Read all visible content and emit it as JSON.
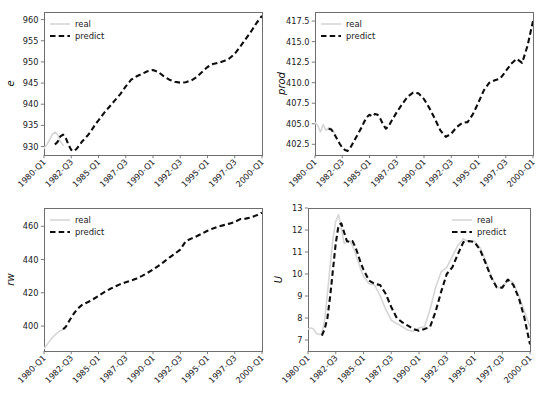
{
  "figure": {
    "width": 537,
    "height": 399,
    "background": "#ffffff",
    "layout": "2x2 grid of time-series subplots",
    "colors": {
      "real": "#d6d6d6",
      "predict": "#0d0d0d",
      "spine": "#6e6e6e",
      "text": "#202020"
    }
  },
  "legend": {
    "real_label": "real",
    "predict_label": "predict"
  },
  "shared": {
    "xticklabels": [
      "1980-Q1",
      "1982-Q3",
      "1985-Q1",
      "1987-Q3",
      "1990-Q1",
      "1992-Q3",
      "1995-Q1",
      "1997-Q3",
      "2000-Q1"
    ]
  },
  "chart_data": [
    {
      "id": "panel-e",
      "type": "line",
      "title": "",
      "xlabel": "",
      "ylabel": "e",
      "legend_position": "upper left",
      "grid": false,
      "xlim": [
        0,
        80
      ],
      "ylim": [
        928.0,
        961.8
      ],
      "yticks": [
        930,
        935,
        940,
        945,
        950,
        955,
        960
      ],
      "yticklabels": [
        "930",
        "935",
        "940",
        "945",
        "950",
        "955",
        "960"
      ],
      "xticks": [
        0,
        10,
        20,
        30,
        40,
        50,
        60,
        70,
        80
      ],
      "xticklabels": [
        "1980-Q1",
        "1982-Q3",
        "1985-Q1",
        "1987-Q3",
        "1990-Q1",
        "1992-Q3",
        "1995-Q1",
        "1997-Q3",
        "2000-Q1"
      ],
      "series": [
        {
          "name": "real",
          "x": [
            0,
            1,
            2,
            3,
            4,
            5,
            6,
            7
          ],
          "values": [
            929.6,
            930.4,
            931.6,
            932.8,
            933.4,
            932.8,
            931.2,
            930.3
          ]
        },
        {
          "name": "predict",
          "x": [
            4,
            5,
            6,
            7,
            8,
            9,
            10,
            11,
            12,
            13,
            14,
            15,
            16,
            17,
            18,
            19,
            20,
            22,
            24,
            26,
            28,
            30,
            32,
            34,
            36,
            38,
            40,
            42,
            44,
            46,
            48,
            50,
            52,
            54,
            56,
            58,
            60,
            62,
            64,
            66,
            68,
            70,
            72,
            74,
            76,
            78,
            80
          ],
          "values": [
            930.5,
            931.1,
            932.4,
            932.8,
            932.0,
            930.4,
            929.2,
            928.9,
            929.5,
            930.3,
            931.2,
            931.9,
            932.6,
            933.4,
            934.4,
            935.4,
            936.2,
            937.9,
            939.4,
            940.9,
            942.4,
            944.2,
            945.8,
            946.6,
            947.2,
            947.8,
            948.1,
            947.6,
            946.6,
            945.8,
            945.3,
            945.1,
            945.2,
            945.6,
            946.4,
            947.6,
            948.8,
            949.5,
            949.8,
            950.2,
            950.8,
            951.9,
            953.6,
            955.4,
            957.2,
            959.2,
            960.9
          ]
        }
      ]
    },
    {
      "id": "panel-prod",
      "type": "line",
      "title": "",
      "xlabel": "",
      "ylabel": "prod",
      "legend_position": "upper left",
      "grid": false,
      "xlim": [
        0,
        80
      ],
      "ylim": [
        401.2,
        418.6
      ],
      "yticks": [
        402.5,
        405.0,
        407.5,
        410.0,
        412.5,
        415.0,
        417.5
      ],
      "yticklabels": [
        "402.5",
        "405.0",
        "407.5",
        "410.0",
        "412.5",
        "415.0",
        "417.5"
      ],
      "xticks": [
        0,
        10,
        20,
        30,
        40,
        50,
        60,
        70,
        80
      ],
      "xticklabels": [
        "1980-Q1",
        "1982-Q3",
        "1985-Q1",
        "1987-Q3",
        "1990-Q1",
        "1992-Q3",
        "1995-Q1",
        "1997-Q3",
        "2000-Q1"
      ],
      "series": [
        {
          "name": "real",
          "x": [
            0,
            1,
            2,
            3,
            4,
            5,
            6,
            7
          ],
          "values": [
            405.1,
            404.8,
            404.0,
            404.9,
            404.2,
            404.5,
            404.4,
            403.9
          ]
        },
        {
          "name": "predict",
          "x": [
            5,
            6,
            7,
            8,
            9,
            10,
            11,
            12,
            13,
            14,
            15,
            16,
            17,
            18,
            19,
            20,
            21,
            22,
            23,
            24,
            25,
            26,
            27,
            28,
            30,
            32,
            34,
            36,
            38,
            40,
            42,
            44,
            46,
            48,
            50,
            52,
            54,
            56,
            58,
            60,
            62,
            64,
            66,
            68,
            70,
            72,
            74,
            76,
            78,
            80
          ],
          "values": [
            404.4,
            404.3,
            403.8,
            403.2,
            402.6,
            402.1,
            401.8,
            401.7,
            402.1,
            402.7,
            403.3,
            403.9,
            404.5,
            405.2,
            405.8,
            406.1,
            405.9,
            406.2,
            406.1,
            405.6,
            404.9,
            404.4,
            404.7,
            405.3,
            406.4,
            407.4,
            408.3,
            408.8,
            408.7,
            408.0,
            406.9,
            405.6,
            404.2,
            403.4,
            403.8,
            404.6,
            405.1,
            405.2,
            406.2,
            407.6,
            409.1,
            410.0,
            410.3,
            410.5,
            411.4,
            412.3,
            412.9,
            412.4,
            414.5,
            417.5
          ]
        }
      ]
    },
    {
      "id": "panel-rw",
      "type": "line",
      "title": "",
      "xlabel": "",
      "ylabel": "rw",
      "legend_position": "upper left",
      "grid": false,
      "xlim": [
        0,
        80
      ],
      "ylim": [
        385.0,
        471.0
      ],
      "yticks": [
        400,
        420,
        440,
        460
      ],
      "yticklabels": [
        "400",
        "420",
        "440",
        "460"
      ],
      "xticks": [
        0,
        10,
        20,
        30,
        40,
        50,
        60,
        70,
        80
      ],
      "xticklabels": [
        "1980-Q1",
        "1982-Q3",
        "1985-Q1",
        "1987-Q3",
        "1990-Q1",
        "1992-Q3",
        "1995-Q1",
        "1997-Q3",
        "2000-Q1"
      ],
      "series": [
        {
          "name": "real",
          "x": [
            0,
            1,
            2,
            3,
            4,
            5,
            6,
            7,
            8
          ],
          "values": [
            386.4,
            388.6,
            390.8,
            392.9,
            394.6,
            396.1,
            397.2,
            398.0,
            398.6
          ]
        },
        {
          "name": "predict",
          "x": [
            7,
            8,
            9,
            10,
            11,
            12,
            13,
            14,
            15,
            16,
            18,
            20,
            22,
            24,
            26,
            28,
            30,
            32,
            34,
            36,
            38,
            40,
            42,
            44,
            46,
            48,
            50,
            52,
            54,
            56,
            58,
            60,
            62,
            64,
            66,
            68,
            70,
            72,
            74,
            76,
            78,
            80
          ],
          "values": [
            398.1,
            399.6,
            402.4,
            405.1,
            407.6,
            409.7,
            411.4,
            412.7,
            413.6,
            414.3,
            416.1,
            418.2,
            420.3,
            422.1,
            423.7,
            425.2,
            426.3,
            427.4,
            428.6,
            430.2,
            432.0,
            434.0,
            436.2,
            438.6,
            441.2,
            443.5,
            446.0,
            451.0,
            452.6,
            454.0,
            455.6,
            457.3,
            458.7,
            459.8,
            460.7,
            461.6,
            462.6,
            464.3,
            464.6,
            465.4,
            466.6,
            468.2
          ]
        }
      ]
    },
    {
      "id": "panel-u",
      "type": "line",
      "title": "",
      "xlabel": "",
      "ylabel": "U",
      "legend_position": "upper right",
      "grid": false,
      "xlim": [
        0,
        80
      ],
      "ylim": [
        6.5,
        13.0
      ],
      "yticks": [
        7,
        8,
        9,
        10,
        11,
        12,
        13
      ],
      "yticklabels": [
        "7",
        "8",
        "9",
        "10",
        "11",
        "12",
        "13"
      ],
      "xticks": [
        0,
        10,
        20,
        30,
        40,
        50,
        60,
        70,
        80
      ],
      "xticklabels": [
        "1980-Q1",
        "1982-Q3",
        "1985-Q1",
        "1987-Q3",
        "1990-Q1",
        "1992-Q3",
        "1995-Q1",
        "1997-Q3",
        "2000-Q1"
      ],
      "series": [
        {
          "name": "real",
          "x": [
            0,
            1,
            2,
            3,
            4,
            5,
            6,
            7,
            8,
            9,
            10,
            11,
            12,
            13,
            14,
            15,
            16,
            17,
            18,
            19,
            20,
            22,
            24,
            26,
            28,
            30,
            32,
            34,
            36,
            38,
            40,
            42,
            44,
            46,
            48,
            50,
            52,
            54,
            56,
            58,
            60,
            62,
            64,
            66,
            68,
            70,
            72,
            74,
            76,
            78,
            80
          ],
          "values": [
            7.5,
            7.55,
            7.5,
            7.3,
            7.25,
            7.3,
            7.9,
            9.1,
            10.4,
            11.6,
            12.4,
            12.7,
            12.1,
            11.4,
            11.45,
            11.5,
            11.3,
            11.0,
            10.6,
            10.2,
            9.9,
            9.55,
            9.5,
            9.0,
            8.4,
            7.9,
            7.75,
            7.6,
            7.45,
            7.4,
            7.55,
            7.6,
            8.4,
            9.4,
            10.1,
            10.3,
            10.8,
            11.3,
            11.6,
            11.45,
            11.5,
            11.2,
            10.6,
            9.9,
            9.4,
            9.35,
            9.75,
            9.6,
            9.0,
            8.3,
            7.6
          ]
        },
        {
          "name": "predict",
          "x": [
            5,
            6,
            7,
            8,
            9,
            10,
            11,
            12,
            13,
            14,
            15,
            16,
            17,
            18,
            19,
            20,
            22,
            24,
            26,
            28,
            30,
            32,
            34,
            36,
            38,
            40,
            42,
            44,
            46,
            48,
            50,
            52,
            54,
            56,
            58,
            60,
            62,
            64,
            66,
            68,
            70,
            72,
            74,
            76,
            78,
            80
          ],
          "values": [
            7.2,
            7.5,
            8.0,
            9.0,
            10.2,
            11.4,
            12.2,
            12.3,
            11.9,
            11.5,
            11.45,
            11.5,
            11.25,
            10.9,
            10.5,
            10.2,
            9.7,
            9.55,
            9.5,
            9.1,
            8.5,
            8.0,
            7.8,
            7.65,
            7.5,
            7.42,
            7.5,
            7.6,
            8.3,
            9.2,
            10.0,
            10.3,
            10.9,
            11.45,
            11.5,
            11.45,
            11.1,
            10.5,
            9.85,
            9.4,
            9.38,
            9.75,
            9.5,
            8.9,
            8.0,
            6.8
          ]
        }
      ]
    }
  ]
}
